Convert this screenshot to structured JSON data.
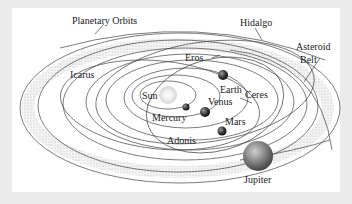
{
  "diagram": {
    "labels": {
      "planetary_orbits": "Planetary Orbits",
      "hidalgo": "Hidalgo",
      "asteroid_belt_line1": "Asteroid",
      "asteroid_belt_line2": "Belt",
      "icarus": "Icarus",
      "eros": "Eros",
      "earth": "Earth",
      "ceres": "Ceres",
      "sun": "Sun",
      "venus": "Venus",
      "mercury": "Mercury",
      "mars": "Mars",
      "adonis": "Adonis",
      "jupiter": "Jupiter"
    },
    "colors": {
      "background": "#ececec",
      "panel": "#ffffff",
      "orbit_line": "#444444",
      "asteroid_belt": "#c8c8c8",
      "sun_glow": "#e8e8e8",
      "planet_dark": "#3a3a3a",
      "jupiter": "#8a8a8a"
    }
  }
}
